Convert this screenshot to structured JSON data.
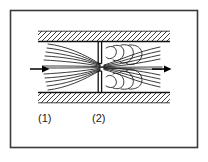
{
  "figure": {
    "type": "technical-diagram",
    "frame": {
      "border_color": "#3a3a3a",
      "background_color": "#ffffff"
    },
    "labels": {
      "upstream_station": "(1)",
      "throat_station": "(2)"
    },
    "colors": {
      "line": "#1a1a1a",
      "wall": "#111111",
      "hatch": "#2b2b2b",
      "arrow": "#000000",
      "background": "#ffffff"
    },
    "elements": {
      "inlet_arrow_name": "inlet-flow-arrow",
      "outlet_arrow_name": "outlet-flow-arrow",
      "orifice_plate_name": "orifice-plate",
      "top_wall_name": "top-pipe-wall",
      "bottom_wall_name": "bottom-pipe-wall",
      "streamlines_name": "streamline-bundle",
      "vortices_name": "recirculation-vortices"
    }
  }
}
